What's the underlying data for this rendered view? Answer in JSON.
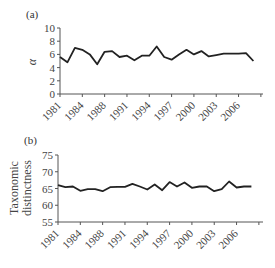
{
  "chart_data": [
    {
      "type": "line",
      "panel_label": "(a)",
      "title": "",
      "xlabel": "",
      "ylabel": "α",
      "ylim": [
        0,
        10
      ],
      "yticks": [
        0,
        2,
        4,
        6,
        8,
        10
      ],
      "xtick_labels": [
        "1981",
        "1984",
        "1988",
        "1991",
        "1994",
        "1997",
        "2000",
        "2003",
        "2006"
      ],
      "x": [
        1981,
        1982,
        1983,
        1984,
        1985,
        1986,
        1987,
        1988,
        1989,
        1990,
        1991,
        1992,
        1993,
        1994,
        1995,
        1996,
        1997,
        1998,
        1999,
        2000,
        2001,
        2002,
        2003,
        2004,
        2005,
        2006,
        2007
      ],
      "series": [
        {
          "name": "alpha",
          "values": [
            5.6,
            4.8,
            7.0,
            6.7,
            6.0,
            4.5,
            6.4,
            6.5,
            5.6,
            5.8,
            5.1,
            5.8,
            5.8,
            7.2,
            5.6,
            5.2,
            6.0,
            6.7,
            6.0,
            6.5,
            5.7,
            5.9,
            6.1,
            6.1,
            6.1,
            6.2,
            5.0
          ]
        }
      ],
      "grid": false,
      "legend": null
    },
    {
      "type": "line",
      "panel_label": "(b)",
      "title": "",
      "xlabel": "",
      "ylabel": "Taxonomic distinctness",
      "ylabel_lines": [
        "Taxonomic",
        "distinctness"
      ],
      "ylim": [
        55,
        75
      ],
      "yticks": [
        55,
        60,
        65,
        70,
        75
      ],
      "xtick_labels": [
        "1981",
        "1984",
        "1988",
        "1991",
        "1994",
        "1997",
        "2000",
        "2003",
        "2006"
      ],
      "x": [
        1981,
        1982,
        1983,
        1984,
        1985,
        1986,
        1987,
        1988,
        1989,
        1990,
        1991,
        1992,
        1993,
        1994,
        1995,
        1996,
        1997,
        1998,
        1999,
        2000,
        2001,
        2002,
        2003,
        2004,
        2005,
        2006,
        2007
      ],
      "series": [
        {
          "name": "taxonomic_distinctness",
          "values": [
            66.0,
            65.4,
            65.6,
            64.3,
            64.8,
            64.8,
            64.2,
            65.4,
            65.5,
            65.5,
            66.4,
            65.6,
            64.7,
            66.2,
            64.5,
            66.9,
            65.6,
            66.8,
            65.2,
            65.6,
            65.6,
            64.2,
            64.8,
            67.1,
            65.3,
            65.6,
            65.6
          ]
        }
      ],
      "grid": false,
      "legend": null
    }
  ]
}
